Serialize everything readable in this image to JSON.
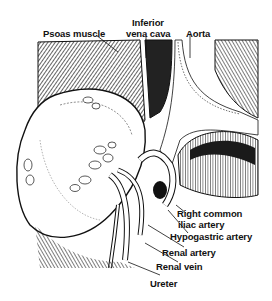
{
  "figure": {
    "labels": {
      "psoas": "Psoas muscle",
      "ivc_line1": "Inferior",
      "ivc_line2": "vena cava",
      "aorta": "Aorta",
      "right_common_iliac_line1": "Right common",
      "right_common_iliac_line2": "iliac artery",
      "hypogastric": "Hypogastric artery",
      "renal_artery": "Renal artery",
      "renal_vein": "Renal vein",
      "ureter": "Ureter"
    },
    "colors": {
      "ink": "#111111",
      "paper": "#ffffff",
      "shade": "#3a3a3a"
    }
  }
}
